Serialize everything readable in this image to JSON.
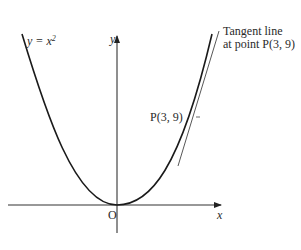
{
  "diagram": {
    "curve_label": {
      "prefix": "y = x",
      "exponent": "2"
    },
    "y_axis_label": "y",
    "x_axis_label": "x",
    "origin_label": "O",
    "point_label": "P(3, 9)",
    "tangent_label_line1": "Tangent line",
    "tangent_label_line2": "at point P(3, 9)",
    "colors": {
      "curve": "#1a1a1a",
      "axis": "#333333",
      "tangent": "#444444",
      "text": "#2a2a2a"
    }
  }
}
